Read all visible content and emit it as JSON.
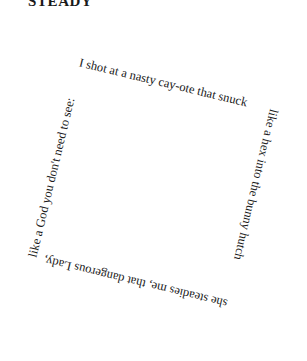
{
  "poem": {
    "title": "STEADY",
    "sides": {
      "top": "I shot at a nasty cay-ote that snuck",
      "right": "like a hex into the bunny hutch",
      "bottom": "she steadies me, that dangerous Lady,",
      "left": "like a God you don't need to see:"
    },
    "full_text": "I shot at a nasty cay-ote that snuck like a hex into the bunny hutch she steadies me, that dangerous Lady, like a God you don't need to see:",
    "colors": {
      "text": "#1a1a1a",
      "background": "#ffffff"
    }
  }
}
